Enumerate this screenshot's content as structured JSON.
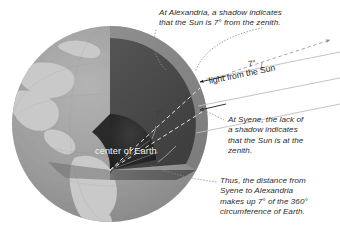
{
  "figure": {
    "background_color": "#ffffff"
  },
  "annotations": {
    "alexandria": "At Alexandria, a shadow indicates\nthat the Sun is 7° from the zenith.",
    "syene": "At Syene, the lack of\na shadow indicates\nthat the Sun is at the\nzenith.",
    "conclusion": "Thus, the distance from\nSyene to Alexandria\nmakes up 7° of the 360°\ncircumference of Earth."
  },
  "labels": {
    "sunlight": "light from the Sun",
    "angle_outer": "7°",
    "angle_inner": "7°",
    "center_of_earth": "center of Earth"
  },
  "diagram_data": {
    "type": "diagram",
    "subject": "Earth cutaway globe with parallel solar rays",
    "angle_at_alexandria_deg": 7,
    "angle_at_center_deg": 7,
    "full_circle_deg": 360,
    "sites": [
      "Alexandria",
      "Syene"
    ],
    "globe": {
      "center_x": 110,
      "center_y": 124,
      "radius": 98,
      "ocean_color": "#9a9a9a",
      "land_color": "#c8c8c8",
      "mantle_color": "#8d8d8d",
      "wedge_dark_color": "#4a4a4a",
      "wedge_mid_color": "#5e5e5e",
      "core_color": "#2a2a2a"
    },
    "rays": {
      "count": 3,
      "color": "#b9b9b9",
      "direction": "from upper right to lower left",
      "slope_deg": -11.5
    },
    "zenith_arrow": {
      "style": "dashed",
      "color": "#9e9e9e"
    }
  }
}
